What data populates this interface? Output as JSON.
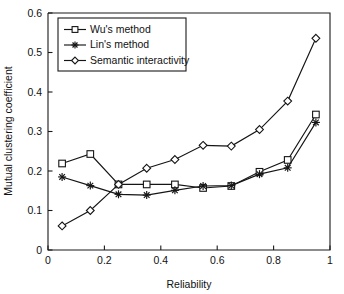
{
  "chart_data": {
    "type": "line",
    "title": "",
    "xlabel": "Reliability",
    "ylabel": "Mutual clustering coefficient",
    "xlim": [
      0,
      1
    ],
    "ylim": [
      0,
      0.6
    ],
    "xticks": [
      "0",
      "0.2",
      "0.4",
      "0.6",
      "0.8",
      "1"
    ],
    "xtick_values": [
      0,
      0.2,
      0.4,
      0.6,
      0.8,
      1
    ],
    "yticks": [
      "0",
      "0.1",
      "0.2",
      "0.3",
      "0.4",
      "0.5",
      "0.6"
    ],
    "ytick_values": [
      0,
      0.1,
      0.2,
      0.3,
      0.4,
      0.5,
      0.6
    ],
    "grid": false,
    "legend_position": "top-left",
    "x": [
      0.05,
      0.15,
      0.25,
      0.35,
      0.45,
      0.55,
      0.65,
      0.75,
      0.85,
      0.95
    ],
    "series": [
      {
        "name": "Wu's method",
        "marker": "square",
        "values": [
          0.219,
          0.243,
          0.166,
          0.166,
          0.166,
          0.157,
          0.162,
          0.198,
          0.228,
          0.343
        ]
      },
      {
        "name": "Lin's method",
        "marker": "star",
        "values": [
          0.185,
          0.163,
          0.141,
          0.139,
          0.151,
          0.162,
          0.163,
          0.192,
          0.208,
          0.323
        ]
      },
      {
        "name": "Semantic interactivity",
        "marker": "diamond",
        "values": [
          0.061,
          0.1,
          0.166,
          0.207,
          0.229,
          0.265,
          0.263,
          0.305,
          0.377,
          0.536
        ]
      }
    ]
  },
  "colors": {
    "line": "#151515",
    "axis": "#1a1a1a",
    "text": "#111111",
    "background": "#ffffff"
  }
}
